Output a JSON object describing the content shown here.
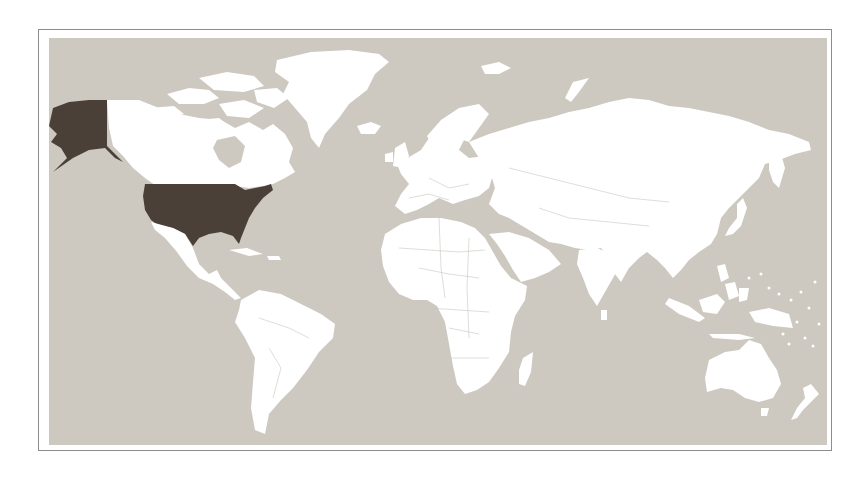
{
  "map": {
    "type": "choropleth-world",
    "projection": "equirectangular",
    "colors": {
      "ocean": "#cdc9c1",
      "land": "#ffffff",
      "highlight": "#4a4038",
      "frame_border": "#8f8d89"
    },
    "highlighted_regions": [
      {
        "name": "United States (contiguous)",
        "color": "#4a4038"
      },
      {
        "name": "Alaska",
        "color": "#4a4038"
      }
    ],
    "legend": null,
    "title": null
  }
}
